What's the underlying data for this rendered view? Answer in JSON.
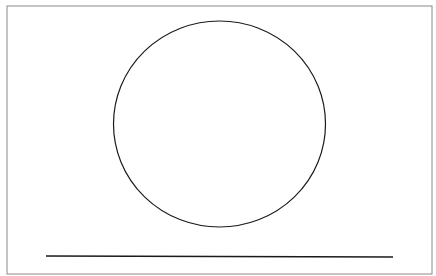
{
  "diagram": {
    "frame": {
      "x": 7,
      "y": 6,
      "width": 425,
      "height": 268,
      "stroke": "#8a8a8a"
    },
    "circle": {
      "cx": 219.5,
      "cy": 124,
      "rx": 106,
      "ry": 103,
      "stroke": "#1a1a1a"
    },
    "baseline": {
      "x1": 46,
      "y1": 256,
      "x2": 393,
      "y2": 257,
      "stroke": "#1a1a1a"
    }
  }
}
